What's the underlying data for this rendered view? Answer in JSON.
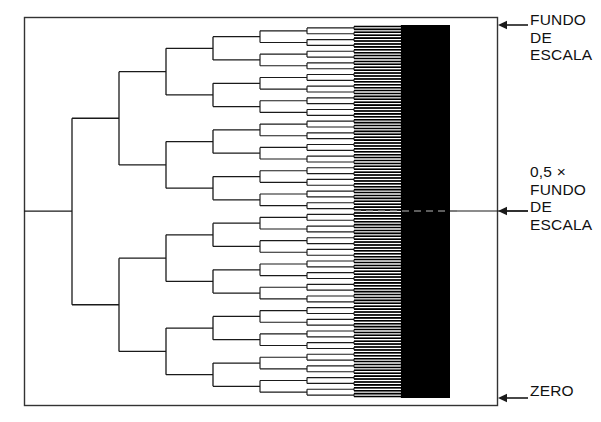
{
  "figure": {
    "name": "successive-approximation-bisection-tree",
    "colors": {
      "ink": "#1a1a1a",
      "background": "#ffffff",
      "solid_block": "#000000"
    }
  },
  "frame": {
    "x": 24,
    "y": 17,
    "width": 473,
    "height": 388,
    "stroke": "#333333",
    "stroke_width": 1.4
  },
  "tree": {
    "root_y": 211,
    "root_x_start": 24,
    "level_x": [
      72,
      119,
      166,
      213,
      260,
      307,
      354,
      401
    ],
    "top_y": 25,
    "bottom_y": 398,
    "levels": 8,
    "solid_start_x": 401,
    "solid_end_x": 450,
    "dense_start_x": 354
  },
  "annotations": [
    {
      "id": "fullscale",
      "name": "label-full-scale",
      "arrow_y": 25,
      "arrow_x_from": 528,
      "arrow_x_to": 498,
      "lines": [
        "FUNDO",
        "DE",
        "ESCALA"
      ]
    },
    {
      "id": "halfscale",
      "name": "label-half-scale",
      "arrow_y": 211,
      "arrow_x_from": 528,
      "arrow_x_to": 498,
      "lines": [
        "0,5 ×",
        "FUNDO",
        "DE",
        "ESCALA"
      ]
    },
    {
      "id": "zero",
      "name": "label-zero",
      "arrow_y": 398,
      "arrow_x_from": 528,
      "arrow_x_to": 498,
      "lines": [
        "ZERO"
      ]
    }
  ],
  "chart_data": {
    "type": "diagram-tree",
    "title": "",
    "scale_markers": [
      "FUNDO DE ESCALA",
      "0,5 × FUNDO DE ESCALA",
      "ZERO"
    ],
    "scale_values": [
      1.0,
      0.5,
      0.0
    ],
    "branch_levels": 8,
    "leaves_at_last_drawn_level": 128
  }
}
